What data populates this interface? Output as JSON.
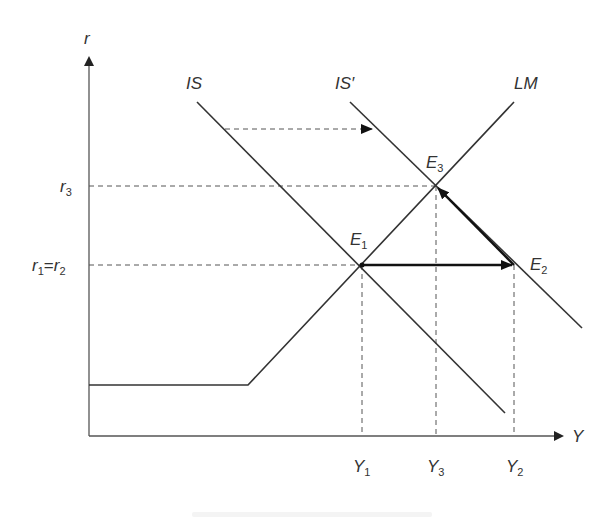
{
  "diagram": {
    "type": "IS-LM model",
    "axes": {
      "y_axis_label": "r",
      "x_axis_label": "Y"
    },
    "curves": {
      "is": "IS",
      "is_prime": "IS′",
      "lm": "LM"
    },
    "equilibria": {
      "e1": {
        "main": "E",
        "sub": "1"
      },
      "e2": {
        "main": "E",
        "sub": "2"
      },
      "e3": {
        "main": "E",
        "sub": "3"
      }
    },
    "interest_rates": {
      "r3": {
        "main": "r",
        "sub": "3"
      },
      "r1_eq_r2": {
        "main1": "r",
        "sub1": "1",
        "eq": "=",
        "main2": "r",
        "sub2": "2"
      }
    },
    "outputs": {
      "y1": {
        "main": "Y",
        "sub": "1"
      },
      "y3": {
        "main": "Y",
        "sub": "3"
      },
      "y2": {
        "main": "Y",
        "sub": "2"
      }
    },
    "annotations": [
      "Dashed arrow: IS shifts right to IS′",
      "Bold arrow: E1 to E2 at constant interest rate r1=r2",
      "Bold arrow: E2 to E3 along IS′ as interest rate rises to r3"
    ],
    "colors": {
      "line": "#333333",
      "axis": "#555555",
      "dashed": "#555555",
      "text": "#333333"
    }
  }
}
